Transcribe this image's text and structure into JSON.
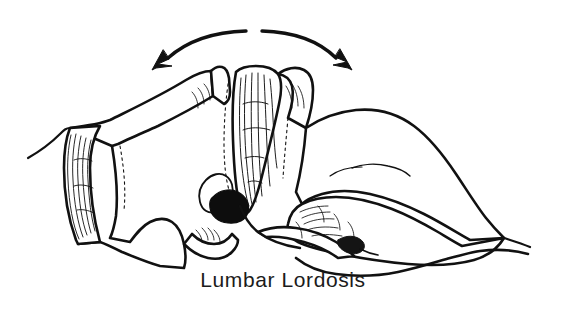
{
  "figure": {
    "kind": "line-drawing",
    "caption": "Lumbar Lordosis",
    "background_color": "#ffffff",
    "ink_color": "#111111",
    "nucleus_color": "#0d0d0d"
  },
  "annotation": {
    "motion_arrow": {
      "name": "double-headed-curved-arrow",
      "meaning": "flexion and extension motion range",
      "head_count": 2,
      "left_head_direction": "down-left",
      "right_head_direction": "down-right"
    }
  },
  "structures": [
    {
      "id": "vertebra-upper",
      "label": "upper lumbar vertebral body"
    },
    {
      "id": "disc-left",
      "label": "intervertebral disc (annulus fibrosus lamellae)"
    },
    {
      "id": "disc-center",
      "label": "wedge intervertebral disc"
    },
    {
      "id": "nucleus-pulposus",
      "label": "nucleus pulposus"
    },
    {
      "id": "vertebra-lower",
      "label": "L5 vertebral body"
    },
    {
      "id": "sacrum",
      "label": "sacrum"
    },
    {
      "id": "sacral-foramen",
      "label": "sacral foramen"
    }
  ]
}
